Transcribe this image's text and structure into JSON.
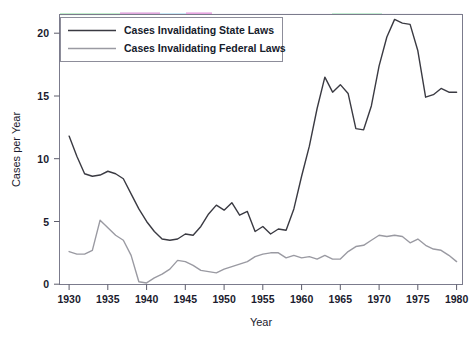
{
  "chart_data": {
    "type": "line",
    "title": "",
    "xlabel": "Year",
    "ylabel": "Cases per Year",
    "xlim": [
      1929,
      1981
    ],
    "ylim": [
      -0.6,
      21.8
    ],
    "xticks": [
      1930,
      1935,
      1940,
      1945,
      1950,
      1955,
      1960,
      1965,
      1970,
      1975,
      1980
    ],
    "xtick_labels": [
      "1930",
      "1935",
      "1940",
      "1945",
      "1950",
      "1955",
      "1960",
      "1965",
      "1970",
      "1975",
      "1980"
    ],
    "yticks": [
      0,
      5,
      10,
      15,
      20
    ],
    "ytick_labels": [
      "0",
      "5",
      "10",
      "15",
      "20"
    ],
    "grid": false,
    "legend_position": "top-left",
    "x": [
      1930,
      1931,
      1932,
      1933,
      1934,
      1935,
      1936,
      1937,
      1938,
      1939,
      1940,
      1941,
      1942,
      1943,
      1944,
      1945,
      1946,
      1947,
      1948,
      1949,
      1950,
      1951,
      1952,
      1953,
      1954,
      1955,
      1956,
      1957,
      1958,
      1959,
      1960,
      1961,
      1962,
      1963,
      1964,
      1965,
      1966,
      1967,
      1968,
      1969,
      1970,
      1971,
      1972,
      1973,
      1974,
      1975,
      1976,
      1977,
      1978,
      1979,
      1980
    ],
    "series": [
      {
        "name": "Cases Invalidating State Laws",
        "color": "#3a3a42",
        "values": [
          11.8,
          10.2,
          8.8,
          8.6,
          8.7,
          9.0,
          8.8,
          8.4,
          7.2,
          6.0,
          5.0,
          4.2,
          3.6,
          3.5,
          3.6,
          4.0,
          3.9,
          4.6,
          5.6,
          6.3,
          5.9,
          6.5,
          5.5,
          5.8,
          4.2,
          4.6,
          4.0,
          4.4,
          4.3,
          6.0,
          8.6,
          11.0,
          14.0,
          16.5,
          15.3,
          15.9,
          15.2,
          12.4,
          12.3,
          14.2,
          17.4,
          19.7,
          21.1,
          20.8,
          20.7,
          18.6,
          14.9,
          15.1,
          15.6,
          15.3,
          15.3
        ]
      },
      {
        "name": "Cases Invalidating Federal Laws",
        "color": "#9a9aa2",
        "values": [
          2.6,
          2.4,
          2.4,
          2.7,
          5.1,
          4.5,
          3.9,
          3.5,
          2.3,
          0.2,
          0.1,
          0.5,
          0.8,
          1.2,
          1.9,
          1.8,
          1.5,
          1.1,
          1.0,
          0.9,
          1.2,
          1.4,
          1.6,
          1.8,
          2.2,
          2.4,
          2.5,
          2.5,
          2.1,
          2.3,
          2.1,
          2.2,
          2.0,
          2.3,
          2.0,
          2.0,
          2.6,
          3.0,
          3.1,
          3.5,
          3.9,
          3.8,
          3.9,
          3.8,
          3.3,
          3.6,
          3.1,
          2.8,
          2.7,
          2.3,
          1.8
        ]
      }
    ]
  },
  "legend": {
    "items": [
      {
        "label": "Cases Invalidating State Laws",
        "swatch": "state-line-swatch"
      },
      {
        "label": "Cases Invalidating Federal Laws",
        "swatch": "federal-line-swatch"
      }
    ]
  },
  "axes": {
    "x_title": "Year",
    "y_title": "Cases per Year"
  }
}
